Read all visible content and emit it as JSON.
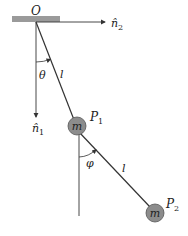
{
  "diagram": {
    "type": "double-pendulum",
    "colors": {
      "line": "#333333",
      "ceiling": "#9a9a9a",
      "mass_fill": "#8c8c8c",
      "mass_stroke": "#555555",
      "background": "#ffffff"
    },
    "labels": {
      "origin": "O",
      "n2": "n̂",
      "n2_sub": "2",
      "n1": "n̂",
      "n1_sub": "1",
      "theta": "θ",
      "phi": "φ",
      "length1": "l",
      "length2": "l",
      "p1": "P",
      "p1_sub": "1",
      "p2": "P",
      "p2_sub": "2",
      "mass1": "m",
      "mass2": "m"
    }
  }
}
